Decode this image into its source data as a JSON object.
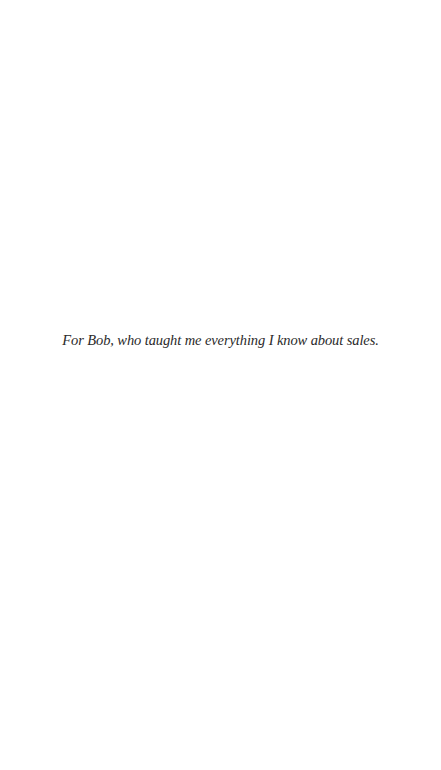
{
  "page": {
    "background": "#ffffff",
    "dedication": "For Bob, who taught me everything I know about sales.",
    "text_color": "#2a2a2a"
  }
}
